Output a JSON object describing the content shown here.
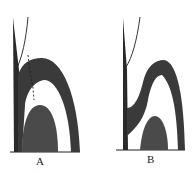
{
  "figures": [
    {
      "id": "A",
      "label": "A"
    },
    {
      "id": "B",
      "label": "B"
    }
  ],
  "colors": {
    "ink": "#1e1e1e",
    "fill_dark": "#3a3a3a",
    "fill_mid": "#4a4a4a",
    "background": "#ffffff"
  }
}
